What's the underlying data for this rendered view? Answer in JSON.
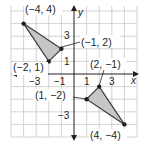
{
  "graph": {
    "x_axis_label": "x",
    "y_axis_label": "y",
    "x_range": [
      -5,
      5
    ],
    "y_range": [
      -5,
      5
    ],
    "x_tick_labels": [
      "−3",
      "−1",
      "1",
      "3"
    ],
    "y_tick_labels": [
      "3",
      "1",
      "−3"
    ],
    "colors": {
      "grid": "#c8c8c8",
      "axis": "#231f20",
      "triangle_fill": "#c6c6c6",
      "triangle_stroke": "#3a3a3a",
      "point": "#231f20"
    }
  },
  "triangles": [
    {
      "name": "triangle-upper-left",
      "vertices": [
        {
          "x": -4,
          "y": 4,
          "label": "(−4, 4)"
        },
        {
          "x": -1,
          "y": 2,
          "label": "(−1, 2)"
        },
        {
          "x": -2,
          "y": 1,
          "label": "(−2, 1)"
        }
      ]
    },
    {
      "name": "triangle-lower-right",
      "vertices": [
        {
          "x": 2,
          "y": -1,
          "label": "(2, −1)"
        },
        {
          "x": 1,
          "y": -2,
          "label": "(1, −2)"
        },
        {
          "x": 4,
          "y": -4,
          "label": "(4, −4)"
        }
      ]
    }
  ]
}
